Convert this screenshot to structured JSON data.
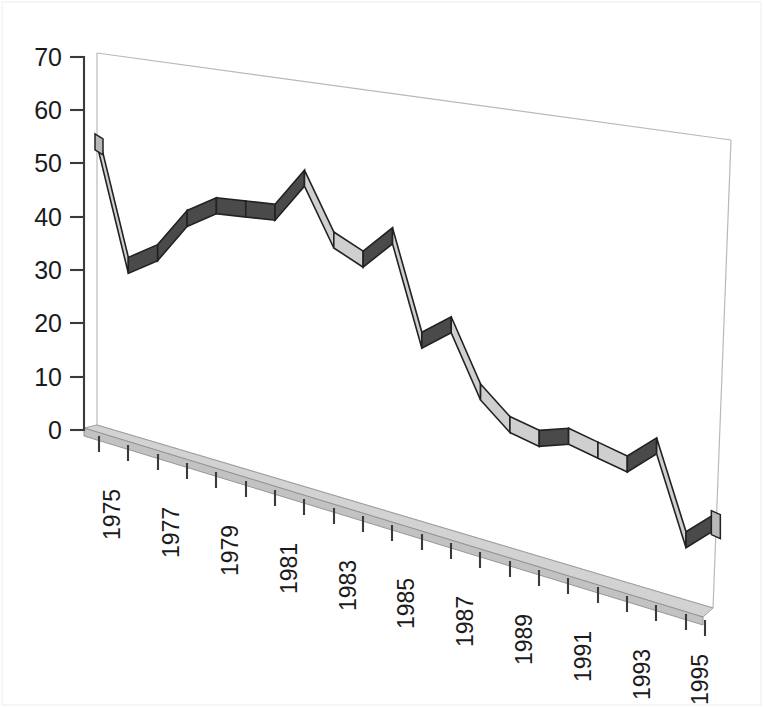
{
  "chart_data": {
    "type": "line",
    "title": "",
    "subtitle": "",
    "xlabel": "",
    "ylabel": "",
    "style": "3d-ribbon-line",
    "grid": false,
    "legend": "none",
    "ylim": [
      0,
      70
    ],
    "ytick_step": 10,
    "ytick_labels": [
      "0",
      "10",
      "20",
      "30",
      "40",
      "50",
      "60",
      "70"
    ],
    "ytick_values": [
      0,
      10,
      20,
      30,
      40,
      50,
      60,
      70
    ],
    "xtick_labels": [
      "1975",
      "1977",
      "1979",
      "1981",
      "1983",
      "1985",
      "1987",
      "1989",
      "1991",
      "1993",
      "1995"
    ],
    "x": [
      1975,
      1976,
      1977,
      1978,
      1979,
      1980,
      1981,
      1982,
      1983,
      1984,
      1985,
      1986,
      1987,
      1988,
      1989,
      1990,
      1991,
      1992,
      1993,
      1994,
      1995,
      1996
    ],
    "categories": [
      "1975",
      "1976",
      "1977",
      "1978",
      "1979",
      "1980",
      "1981",
      "1982",
      "1983",
      "1984",
      "1985",
      "1986",
      "1987",
      "1988",
      "1989",
      "1990",
      "1991",
      "1992",
      "1993",
      "1994",
      "1995",
      "1996"
    ],
    "values": [
      55,
      34,
      38,
      46,
      50,
      51,
      52,
      60,
      50,
      48,
      54,
      36,
      40.5,
      29.5,
      25,
      24,
      26,
      25,
      24,
      29,
      13,
      18
    ],
    "series": [
      {
        "name": "series-1",
        "values": [
          55,
          34,
          38,
          46,
          50,
          51,
          52,
          60,
          50,
          48,
          54,
          36,
          40.5,
          29.5,
          25,
          24,
          26,
          25,
          24,
          29,
          13,
          18
        ]
      }
    ],
    "colors": {
      "rising_segment": "#4a4a4a",
      "falling_segment": "#cfcfcf",
      "outline": "#222222",
      "floor": "#d2d2d2",
      "wall_edge": "#b9b9b9",
      "axis": "#3a3a3a",
      "background": "#ffffff"
    }
  },
  "axes": {
    "y_axis_name": "value-axis",
    "x_axis_name": "year-axis"
  }
}
